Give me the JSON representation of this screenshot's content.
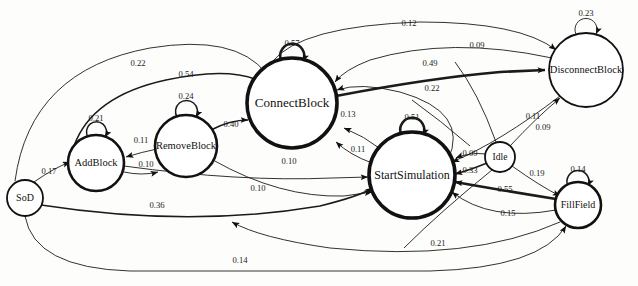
{
  "figure": {
    "type": "state-transition-diagram",
    "title": "",
    "nodes": [
      {
        "id": "SoD",
        "label": "SoD",
        "cx": 25,
        "cy": 198,
        "r": 18,
        "weight": "thin",
        "font": 10
      },
      {
        "id": "AddBlock",
        "label": "AddBlock",
        "cx": 96,
        "cy": 163,
        "r": 28,
        "weight": "med",
        "font": 10.5
      },
      {
        "id": "RemoveBlock",
        "label": "RemoveBlock",
        "cx": 186,
        "cy": 146,
        "r": 31,
        "weight": "med",
        "font": 10.5
      },
      {
        "id": "ConnectBlock",
        "label": "ConnectBlock",
        "cx": 292,
        "cy": 103,
        "r": 45,
        "weight": "thick",
        "font": 13
      },
      {
        "id": "StartSimulation",
        "label": "StartSimulation",
        "cx": 412,
        "cy": 175,
        "r": 43,
        "weight": "thick",
        "font": 12
      },
      {
        "id": "DisconnectBlock",
        "label": "DisconnectBlock",
        "cx": 586,
        "cy": 70,
        "r": 37,
        "weight": "thin",
        "font": 10.5
      },
      {
        "id": "Idle",
        "label": "Idle",
        "cx": 500,
        "cy": 157,
        "r": 15,
        "weight": "thin",
        "font": 9.5
      },
      {
        "id": "FillField",
        "label": "FillField",
        "cx": 578,
        "cy": 205,
        "r": 23,
        "weight": "med",
        "font": 10
      }
    ],
    "self_loops": [
      {
        "node": "AddBlock",
        "value": "0.21",
        "lx": 96,
        "ly": 121
      },
      {
        "node": "RemoveBlock",
        "value": "0.24",
        "lx": 186,
        "ly": 99
      },
      {
        "node": "ConnectBlock",
        "value": "0.57",
        "lx": 292,
        "ly": 46
      },
      {
        "node": "StartSimulation",
        "value": "0.51",
        "lx": 412,
        "ly": 120
      },
      {
        "node": "DisconnectBlock",
        "value": "0.23",
        "lx": 586,
        "ly": 16
      },
      {
        "node": "FillField",
        "value": "0.14",
        "lx": 578,
        "ly": 172
      }
    ],
    "edges": [
      {
        "from": "SoD",
        "to": "AddBlock",
        "value": "0.17",
        "lx": 49,
        "ly": 174
      },
      {
        "from": "SoD",
        "to": "ConnectBlock",
        "value": "0.22",
        "lx": 138,
        "ly": 66
      },
      {
        "from": "SoD",
        "to": "StartSimulation",
        "value": "0.36",
        "lx": 157,
        "ly": 208
      },
      {
        "from": "SoD",
        "to": "FillField",
        "value": "0.14",
        "lx": 240,
        "ly": 263
      },
      {
        "from": "AddBlock",
        "to": "ConnectBlock",
        "value": "0.54",
        "lx": 186,
        "ly": 77
      },
      {
        "from": "AddBlock",
        "to": "StartSimulation",
        "value": "0.10",
        "lx": 289,
        "ly": 164
      },
      {
        "from": "RemoveBlock",
        "to": "AddBlock",
        "value": "0.11",
        "lx": 141,
        "ly": 143
      },
      {
        "from": "AddBlock",
        "to": "RemoveBlock",
        "value": "0.10",
        "lx": 146,
        "ly": 167
      },
      {
        "from": "RemoveBlock",
        "to": "ConnectBlock",
        "value": "0.40",
        "lx": 231,
        "ly": 127
      },
      {
        "from": "RemoveBlock",
        "to": "StartSimulation",
        "value": "0.10",
        "lx": 258,
        "ly": 191
      },
      {
        "from": "ConnectBlock",
        "to": "DisconnectBlock",
        "value": "0.12",
        "lx": 409,
        "ly": 26
      },
      {
        "from": "ConnectBlock",
        "to": "DisconnectBlock",
        "value": "0.49",
        "lx": 430,
        "ly": 66
      },
      {
        "from": "DisconnectBlock",
        "to": "ConnectBlock",
        "value": "0.09",
        "lx": 477,
        "ly": 48
      },
      {
        "from": "StartSimulation",
        "to": "ConnectBlock",
        "value": "0.13",
        "lx": 348,
        "ly": 117
      },
      {
        "from": "StartSimulation",
        "to": "ConnectBlock",
        "value": "0.11",
        "lx": 358,
        "ly": 152
      },
      {
        "from": "StartSimulation",
        "to": "ConnectBlock",
        "value": "0.22",
        "lx": 432,
        "ly": 91
      },
      {
        "from": "DisconnectBlock",
        "to": "StartSimulation",
        "value": "0.11",
        "lx": 533,
        "ly": 119
      },
      {
        "from": "Idle",
        "to": "DisconnectBlock",
        "value": "0.09",
        "lx": 543,
        "ly": 130
      },
      {
        "from": "Idle",
        "to": "StartSimulation",
        "value": "0.09",
        "lx": 470,
        "ly": 156
      },
      {
        "from": "Idle",
        "to": "StartSimulation",
        "value": "0.33",
        "lx": 470,
        "ly": 173
      },
      {
        "from": "Idle",
        "to": "FillField",
        "value": "0.19",
        "lx": 537,
        "ly": 176
      },
      {
        "from": "FillField",
        "to": "StartSimulation",
        "value": "0.55",
        "lx": 505,
        "ly": 192
      },
      {
        "from": "FillField",
        "to": "StartSimulation",
        "value": "0.15",
        "lx": 508,
        "ly": 216
      },
      {
        "from": "FillField",
        "to": "StartSimulation",
        "value": "0.21",
        "lx": 438,
        "ly": 246
      }
    ]
  }
}
